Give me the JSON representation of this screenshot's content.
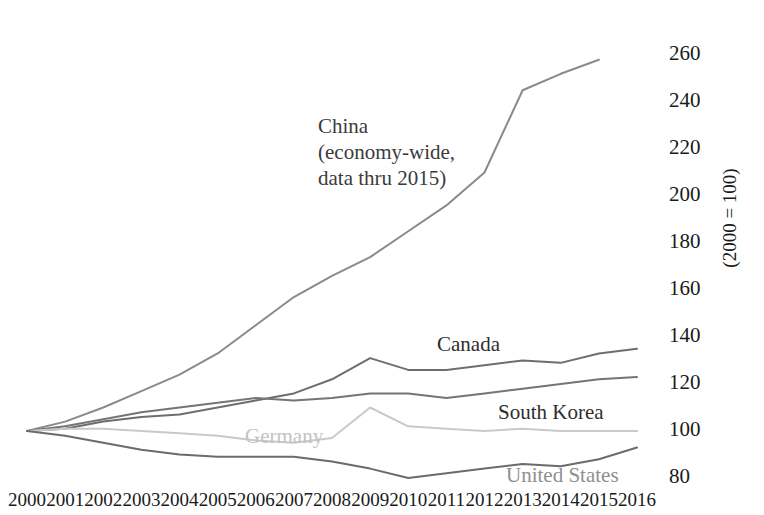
{
  "chart_data": {
    "type": "line",
    "title": "",
    "subtitle": "",
    "xlabel": "",
    "ylabel": "(2000 = 100)",
    "grid": false,
    "legend_position": "inline-annotations",
    "x": [
      2000,
      2001,
      2002,
      2003,
      2004,
      2005,
      2006,
      2007,
      2008,
      2009,
      2010,
      2011,
      2012,
      2013,
      2014,
      2015,
      2016
    ],
    "xticklabels": [
      "2000",
      "2001",
      "2002",
      "2003",
      "2004",
      "2005",
      "2006",
      "2007",
      "2008",
      "2009",
      "2010",
      "2011",
      "2012",
      "2013",
      "2014",
      "2015",
      "2016"
    ],
    "yticklabels": [
      "260",
      "240",
      "220",
      "200",
      "180",
      "160",
      "140",
      "120",
      "100",
      "80"
    ],
    "yticks": [
      260,
      240,
      220,
      200,
      180,
      160,
      140,
      120,
      100,
      80
    ],
    "xlim": [
      2000,
      2016
    ],
    "ylim": [
      76,
      264
    ],
    "series": [
      {
        "name": "China",
        "label": "China\n(economy-wide,\ndata thru 2015)",
        "label_lines": [
          "China",
          "(economy-wide,",
          "data thru 2015)"
        ],
        "color": "#8a8a8a",
        "x": [
          2000,
          2001,
          2002,
          2003,
          2004,
          2005,
          2006,
          2007,
          2008,
          2009,
          2010,
          2011,
          2012,
          2013,
          2014,
          2015
        ],
        "values": [
          100,
          104,
          110,
          117,
          124,
          133,
          145,
          157,
          166,
          174,
          185,
          196,
          210,
          245,
          252,
          258
        ]
      },
      {
        "name": "Canada",
        "label": "Canada",
        "color": "#6e6e6e",
        "x": [
          2000,
          2001,
          2002,
          2003,
          2004,
          2005,
          2006,
          2007,
          2008,
          2009,
          2010,
          2011,
          2012,
          2013,
          2014,
          2015,
          2016
        ],
        "values": [
          100,
          101,
          104,
          106,
          107,
          110,
          113,
          116,
          122,
          131,
          126,
          126,
          128,
          130,
          129,
          133,
          135
        ]
      },
      {
        "name": "South Korea",
        "label": "South Korea",
        "color": "#757575",
        "x": [
          2000,
          2001,
          2002,
          2003,
          2004,
          2005,
          2006,
          2007,
          2008,
          2009,
          2010,
          2011,
          2012,
          2013,
          2014,
          2015,
          2016
        ],
        "values": [
          100,
          102,
          105,
          108,
          110,
          112,
          114,
          113,
          114,
          116,
          116,
          114,
          116,
          118,
          120,
          122,
          123
        ]
      },
      {
        "name": "Germany",
        "label": "Germany",
        "color": "#c9c9c9",
        "x": [
          2000,
          2001,
          2002,
          2003,
          2004,
          2005,
          2006,
          2007,
          2008,
          2009,
          2010,
          2011,
          2012,
          2013,
          2014,
          2015,
          2016
        ],
        "values": [
          100,
          101,
          101,
          100,
          99,
          98,
          96,
          95,
          97,
          110,
          102,
          101,
          100,
          101,
          100,
          100,
          100
        ]
      },
      {
        "name": "United States",
        "label": "United States",
        "color": "#6b6b6b",
        "x": [
          2000,
          2001,
          2002,
          2003,
          2004,
          2005,
          2006,
          2007,
          2008,
          2009,
          2010,
          2011,
          2012,
          2013,
          2014,
          2015,
          2016
        ],
        "values": [
          100,
          98,
          95,
          92,
          90,
          89,
          89,
          89,
          87,
          84,
          80,
          82,
          84,
          86,
          85,
          88,
          93
        ]
      }
    ]
  },
  "axis": {
    "y_unit_note": "(2000 = 100)"
  }
}
